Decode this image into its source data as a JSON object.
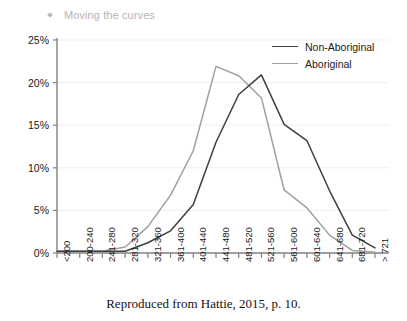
{
  "header": {
    "bullet_icon": "diamond-bullet-icon",
    "title": "Moving the curves"
  },
  "caption": "Reproduced from Hattie, 2015, p. 10.",
  "colors": {
    "non_aboriginal": "#3f3f3f",
    "aboriginal": "#a0a0a0",
    "axis": "#808080",
    "grid": "#efefef",
    "header_text": "#b4b4b4",
    "caption_text": "#131313"
  },
  "chart_data": {
    "type": "line",
    "title": "",
    "xlabel": "",
    "ylabel": "",
    "ylim": [
      0,
      25
    ],
    "yticks": [
      0,
      5,
      10,
      15,
      20,
      25
    ],
    "ytick_labels": [
      "0%",
      "5%",
      "10%",
      "15%",
      "20%",
      "25%"
    ],
    "grid": true,
    "legend_position": "top-right",
    "categories": [
      "<200",
      "200-240",
      "241-280",
      "281-320",
      "321-360",
      "361-400",
      "401-440",
      "441-480",
      "481-520",
      "521-560",
      "561-600",
      "601-640",
      "641-680",
      "681-720",
      "> 721"
    ],
    "series": [
      {
        "name": "Non-Aboriginal",
        "color": "#3f3f3f",
        "values": [
          0.2,
          0.2,
          0.2,
          0.2,
          1.2,
          2.6,
          5.7,
          13.0,
          18.6,
          20.9,
          15.1,
          13.2,
          7.3,
          2.1,
          0.6
        ]
      },
      {
        "name": "Aboriginal",
        "color": "#a0a0a0",
        "values": [
          0.2,
          0.2,
          0.2,
          0.7,
          3.1,
          6.8,
          12.0,
          21.9,
          20.8,
          18.2,
          7.4,
          5.3,
          2.1,
          0.3,
          0.1
        ]
      }
    ]
  }
}
